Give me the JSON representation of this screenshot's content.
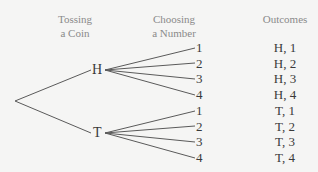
{
  "headers": {
    "stage1_line1": "Tossing",
    "stage1_line2": "a Coin",
    "stage2_line1": "Choosing",
    "stage2_line2": "a Number",
    "outcomes": "Outcomes"
  },
  "nodes": {
    "heads": "H",
    "tails": "T"
  },
  "numbers": {
    "heads": [
      "1",
      "2",
      "3",
      "4"
    ],
    "tails": [
      "1",
      "2",
      "3",
      "4"
    ]
  },
  "outcomes": [
    "H, 1",
    "H, 2",
    "H, 3",
    "H, 4",
    "T, 1",
    "T, 2",
    "T, 3",
    "T, 4"
  ],
  "colors": {
    "background": "#f5f5f4",
    "header_text": "#8a8a8a",
    "text": "#3a3a3a",
    "lines": "#5a5a5a"
  }
}
